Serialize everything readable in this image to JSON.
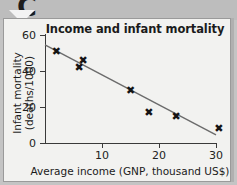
{
  "badge": {
    "letter": "C",
    "arrow_icon": "chevron-down-icon"
  },
  "chart_data": {
    "type": "scatter",
    "title": "Income and infant mortality",
    "xlabel": "Average income (GNP, thousand US$)",
    "ylabel": "Infant mortality (deaths/1000)",
    "xlim": [
      0,
      30
    ],
    "ylim": [
      0,
      60
    ],
    "xticks": [
      0,
      10,
      20,
      30
    ],
    "yticks": [
      0,
      20,
      40,
      60
    ],
    "xtick_labels": [
      "0",
      "10",
      "20",
      "30"
    ],
    "ytick_labels": [
      "0",
      "20",
      "40",
      "60"
    ],
    "grid": false,
    "legend": null,
    "marker_symbol": "✖",
    "marker_color": "#141414",
    "trendline_color": "#6b6b6b",
    "points": [
      {
        "x": 2.0,
        "y": 51
      },
      {
        "x": 6.0,
        "y": 42
      },
      {
        "x": 6.7,
        "y": 46
      },
      {
        "x": 15.0,
        "y": 29
      },
      {
        "x": 18.2,
        "y": 17
      },
      {
        "x": 23.0,
        "y": 15
      },
      {
        "x": 30.5,
        "y": 8
      }
    ],
    "trendline": {
      "type": "linear-fit",
      "x_start": 0.0,
      "y_start": 54.5,
      "x_end": 30.0,
      "y_end": 4.5
    }
  }
}
